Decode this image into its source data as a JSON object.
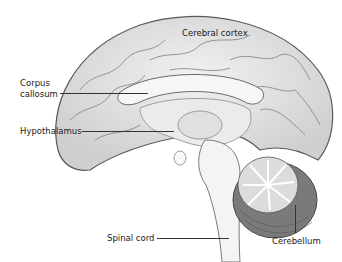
{
  "diagram": {
    "type": "anatomical-illustration",
    "labels": [
      {
        "id": "cerebral-cortex",
        "text": "Cerebral cortex"
      },
      {
        "id": "corpus-callosum",
        "text": "Corpus callosum",
        "lines": [
          "Corpus",
          "callosum"
        ]
      },
      {
        "id": "hypothalamus",
        "text": "Hypothalamus"
      },
      {
        "id": "spinal-cord",
        "text": "Spinal cord"
      },
      {
        "id": "cerebellum",
        "text": "Cerebellum"
      }
    ],
    "colors": {
      "background": "#ffffff",
      "cortex_fill": "#e6e6e6",
      "cortex_stroke": "#5a5a5a",
      "inner_fill": "#f4f4f4",
      "cerebellum_dark": "#6e6e6e",
      "label_text": "#222222"
    }
  }
}
